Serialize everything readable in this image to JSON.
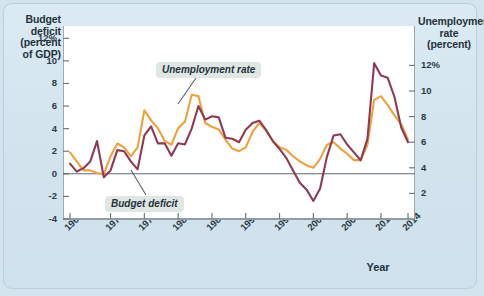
{
  "axes": {
    "left_title": "Budget deficit (percent of GDP)",
    "left_title_lines": [
      "Budget",
      "deficit",
      "(percent",
      "of GDP)"
    ],
    "right_title_lines": [
      "Unemployment",
      "rate",
      "(percent)"
    ],
    "x_title": "Year",
    "left_ticks": [
      "12%",
      "10",
      "8",
      "6",
      "4",
      "2",
      "0",
      "-2",
      "-4"
    ],
    "right_ticks": [
      "12%",
      "10",
      "8",
      "6",
      "4",
      "2"
    ],
    "x_ticks": [
      "1964",
      "1970",
      "1975",
      "1980",
      "1985",
      "1990",
      "1995",
      "2000",
      "2005",
      "2010",
      "2014"
    ]
  },
  "annotations": {
    "unemployment_label": "Unemployment rate",
    "deficit_label": "Budget deficit"
  },
  "colors": {
    "unemployment": "#efa13c",
    "deficit": "#8e3a52",
    "background": "#d3e4ef",
    "plot_area": "#ffffff",
    "axis": "#6f7b83",
    "callout_bg": "#dfe6e3"
  },
  "chart_data": {
    "type": "line",
    "title": "",
    "xlabel": "Year",
    "ylabel": "Budget deficit (percent of GDP)",
    "y2label": "Unemployment rate (percent)",
    "ylim": [
      -4,
      13
    ],
    "y2lim": [
      0,
      15
    ],
    "xlim": [
      1964,
      2014
    ],
    "grid": false,
    "legend": "annotated-callouts",
    "note": "Left axis = budget deficit (percent of GDP). Right axis = unemployment rate (percent); right axis is offset so left 0 aligns with right 4.",
    "x": [
      1964,
      1965,
      1966,
      1967,
      1968,
      1969,
      1970,
      1971,
      1972,
      1973,
      1974,
      1975,
      1976,
      1977,
      1978,
      1979,
      1980,
      1981,
      1982,
      1983,
      1984,
      1985,
      1986,
      1987,
      1988,
      1989,
      1990,
      1991,
      1992,
      1993,
      1994,
      1995,
      1996,
      1997,
      1998,
      1999,
      2000,
      2001,
      2002,
      2003,
      2004,
      2005,
      2006,
      2007,
      2008,
      2009,
      2010,
      2011,
      2012,
      2013,
      2014
    ],
    "series": [
      {
        "name": "Budget deficit",
        "axis": "left",
        "color": "#8e3a52",
        "units": "percent of GDP",
        "values": [
          0.9,
          0.2,
          0.5,
          1.1,
          2.9,
          -0.3,
          0.3,
          2.1,
          2.0,
          1.1,
          0.4,
          3.4,
          4.2,
          2.7,
          2.7,
          1.6,
          2.7,
          2.6,
          4.0,
          6.0,
          4.8,
          5.1,
          5.0,
          3.2,
          3.1,
          2.8,
          3.9,
          4.5,
          4.7,
          3.9,
          2.9,
          2.2,
          1.4,
          0.3,
          -0.8,
          -1.4,
          -2.4,
          -1.3,
          1.5,
          3.4,
          3.5,
          2.6,
          1.9,
          1.2,
          3.1,
          9.8,
          8.7,
          8.5,
          6.8,
          4.1,
          2.8
        ]
      },
      {
        "name": "Unemployment rate",
        "axis": "right",
        "color": "#efa13c",
        "units": "percent",
        "values": [
          5.2,
          4.5,
          3.8,
          3.8,
          3.6,
          3.5,
          4.9,
          5.9,
          5.6,
          4.9,
          5.6,
          8.5,
          7.7,
          7.1,
          6.1,
          5.8,
          7.1,
          7.6,
          9.7,
          9.6,
          7.5,
          7.2,
          7.0,
          6.2,
          5.5,
          5.3,
          5.6,
          6.8,
          7.5,
          6.9,
          6.1,
          5.6,
          5.4,
          4.9,
          4.5,
          4.2,
          4.0,
          4.7,
          5.8,
          6.0,
          5.5,
          5.1,
          4.6,
          4.6,
          5.8,
          9.3,
          9.6,
          8.9,
          8.1,
          7.4,
          6.2
        ]
      }
    ]
  }
}
